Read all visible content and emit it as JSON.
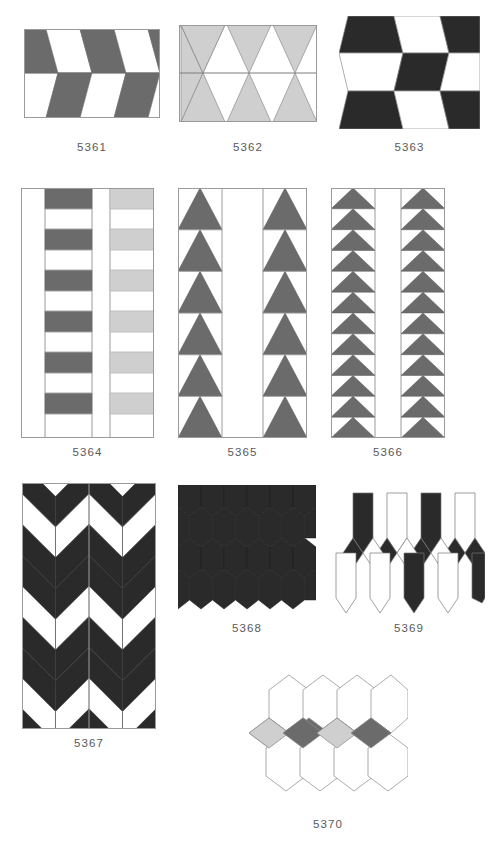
{
  "page": {
    "background": "#ffffff",
    "width": 501,
    "height": 847
  },
  "palette": {
    "dark_gray": "#6b6b6b",
    "light_gray": "#cfcfcf",
    "near_black": "#2a2a2a",
    "white": "#ffffff",
    "outline": "#8b8b8b",
    "thin_outline": "#9a9a9a",
    "caption_color": "#59595b"
  },
  "patterns": [
    {
      "id": "5361",
      "label": "5361",
      "row": 1,
      "column": 1,
      "description": "Two rows of alternating dark-gray and white trapezoids",
      "colors": [
        "#6b6b6b",
        "#ffffff"
      ],
      "shape": "trapezoid",
      "rows": 2,
      "units_per_row": 4
    },
    {
      "id": "5362",
      "label": "5362",
      "row": 1,
      "column": 2,
      "description": "Three light-gray elongated hexagons split across a horizontal seam",
      "colors": [
        "#cfcfcf",
        "#ffffff"
      ],
      "shape": "hexagon",
      "rows": 2,
      "units_per_row": 3
    },
    {
      "id": "5363",
      "label": "5363",
      "row": 1,
      "column": 3,
      "description": "Three rows of alternating black and white trapezoids",
      "colors": [
        "#2a2a2a",
        "#ffffff"
      ],
      "shape": "trapezoid",
      "rows": 3,
      "units_per_row": 3
    },
    {
      "id": "5364",
      "label": "5364",
      "row": 2,
      "column": 1,
      "description": "Four vertical bands: blank, dark-gray rectangles, blank, light-gray rectangles",
      "colors": [
        "#6b6b6b",
        "#cfcfcf",
        "#ffffff"
      ],
      "shape": "rectangle",
      "bands": 4,
      "units_per_band": 6
    },
    {
      "id": "5365",
      "label": "5365",
      "row": 2,
      "column": 2,
      "description": "Two columns of six upward dark-gray triangles separated by a blank column",
      "colors": [
        "#6b6b6b",
        "#ffffff"
      ],
      "shape": "triangle",
      "bands": 3,
      "units_per_band": 6
    },
    {
      "id": "5366",
      "label": "5366",
      "row": 2,
      "column": 3,
      "description": "Two columns of twelve shallow dark-gray triangles separated by a blank column",
      "colors": [
        "#6b6b6b",
        "#ffffff"
      ],
      "shape": "triangle",
      "bands": 3,
      "units_per_band": 12
    },
    {
      "id": "5367",
      "label": "5367",
      "row": 3,
      "column": 1,
      "description": "Two panels of black and white chevron herringbone",
      "colors": [
        "#2a2a2a",
        "#ffffff"
      ],
      "shape": "chevron",
      "panels": 2,
      "chevron_rows": 8
    },
    {
      "id": "5368",
      "label": "5368",
      "row": 3,
      "column": 2,
      "description": "Grid of black elongated hexagons with small white diamond interstices",
      "colors": [
        "#2a2a2a",
        "#ffffff"
      ],
      "shape": "hexagon",
      "rows": 4,
      "units_per_row": 6
    },
    {
      "id": "5369",
      "label": "5369",
      "row": 3,
      "column": 3,
      "description": "Offset black and white elongated hexagons with rhombus connectors",
      "colors": [
        "#2a2a2a",
        "#ffffff"
      ],
      "shape": "hexagon",
      "rows": 2,
      "units_per_row": 4
    },
    {
      "id": "5370",
      "label": "5370",
      "row": 4,
      "column": 2,
      "description": "White elongated hexagons with a middle band of alternating light-gray and dark-gray rhombi",
      "colors": [
        "#ffffff",
        "#cfcfcf",
        "#6b6b6b"
      ],
      "shape": "hexagon",
      "rows": 2,
      "units_per_row": 4
    }
  ]
}
